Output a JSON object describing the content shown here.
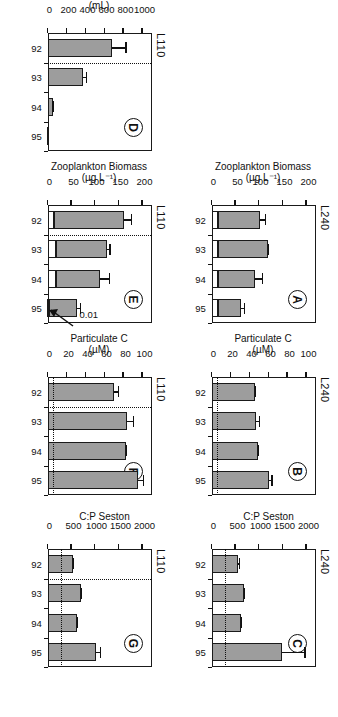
{
  "figure": {
    "years": [
      "92",
      "93",
      "94",
      "95"
    ],
    "lake_left": "L240",
    "lake_right": "L110",
    "bar_color": "#9d9d9d",
    "line_color": "#111111"
  },
  "panels": {
    "A": {
      "letter": "A",
      "lake": "L240",
      "axis_title": "Zooplankton Biomass",
      "axis_unit": "(µg L⁻¹)",
      "ticks": [
        "0",
        "50",
        "100",
        "150",
        "200"
      ],
      "categories": [
        "92",
        "93",
        "94",
        "95"
      ],
      "values": [
        102,
        118,
        92,
        62
      ],
      "base_values": [
        12,
        12,
        12,
        12
      ],
      "errors": [
        12,
        3,
        16,
        8
      ],
      "refline": null,
      "sepline": null
    },
    "B": {
      "letter": "B",
      "lake": "L240",
      "axis_title": "Particulate C",
      "axis_unit": "(µM)",
      "ticks": [
        "0",
        "20",
        "40",
        "60",
        "80",
        "100"
      ],
      "categories": [
        "92",
        "93",
        "94",
        "95"
      ],
      "values": [
        46,
        47,
        49,
        60
      ],
      "base_values": [
        0,
        0,
        0,
        0
      ],
      "errors": [
        1,
        4,
        1,
        4
      ],
      "refline": 6,
      "sepline": null
    },
    "C": {
      "letter": "C",
      "lake": "L240",
      "axis_title": "C:P Seston",
      "axis_unit": "",
      "ticks": [
        "0",
        "500",
        "1000",
        "1500",
        "2000"
      ],
      "categories": [
        "92",
        "93",
        "94",
        "95"
      ],
      "values": [
        560,
        680,
        620,
        1480
      ],
      "base_values": [
        0,
        0,
        0,
        0
      ],
      "errors": [
        40,
        20,
        15,
        500
      ],
      "refline": 300,
      "sepline": null
    },
    "D": {
      "letter": "D",
      "lake": "L110",
      "axis_title": "CPUE",
      "axis_unit": "(mL)",
      "ticks": [
        "0",
        "200",
        "400",
        "600",
        "800",
        "1000"
      ],
      "categories": [
        "92",
        "93",
        "94",
        "95"
      ],
      "values": [
        672,
        375,
        48,
        8
      ],
      "base_values": [
        0,
        0,
        0,
        0
      ],
      "errors": [
        160,
        40,
        12,
        0
      ],
      "refline": null,
      "sepline": true
    },
    "E": {
      "letter": "E",
      "lake": "L110",
      "axis_title": "Zooplankton Biomass",
      "axis_unit": "(µg L⁻¹)",
      "ticks": [
        "0",
        "50",
        "100",
        "150",
        "200"
      ],
      "categories": [
        "92",
        "93",
        "94",
        "95"
      ],
      "values": [
        160,
        124,
        110,
        62
      ],
      "base_values": [
        12,
        17,
        17,
        3
      ],
      "errors": [
        18,
        9,
        22,
        8
      ],
      "refline": null,
      "sepline": true,
      "annotation": {
        "label": "0.01",
        "target_category": "95"
      }
    },
    "F": {
      "letter": "F",
      "lake": "L110",
      "axis_title": "Particulate C",
      "axis_unit": "(µM)",
      "ticks": [
        "0",
        "20",
        "40",
        "60",
        "80",
        "100"
      ],
      "categories": [
        "92",
        "93",
        "94",
        "95"
      ],
      "values": [
        70,
        84,
        82,
        95
      ],
      "base_values": [
        0,
        0,
        0,
        0
      ],
      "errors": [
        5,
        7,
        2,
        7
      ],
      "refline": 6,
      "sepline": true
    },
    "G": {
      "letter": "G",
      "lake": "L110",
      "axis_title": "C:P Seston",
      "axis_unit": "",
      "ticks": [
        "0",
        "500",
        "1000",
        "1500",
        "2000"
      ],
      "categories": [
        "92",
        "93",
        "94",
        "95"
      ],
      "values": [
        520,
        700,
        620,
        1020
      ],
      "base_values": [
        0,
        0,
        0,
        0
      ],
      "errors": [
        30,
        25,
        15,
        110
      ],
      "refline": 300,
      "sepline": true
    }
  },
  "chart_data": [
    {
      "type": "bar",
      "title": "A",
      "subtitle": "L240",
      "categories": [
        "92",
        "93",
        "94",
        "95"
      ],
      "values": [
        102,
        118,
        92,
        62
      ],
      "errors": [
        12,
        3,
        16,
        8
      ],
      "stacked_base": [
        12,
        12,
        12,
        12
      ],
      "xlabel": "",
      "ylabel": "Zooplankton Biomass (µg L⁻¹)",
      "ylim": [
        0,
        200
      ],
      "yticks": [
        0,
        50,
        100,
        150,
        200
      ],
      "grid": false,
      "legend": "none"
    },
    {
      "type": "bar",
      "title": "B",
      "subtitle": "L240",
      "categories": [
        "92",
        "93",
        "94",
        "95"
      ],
      "values": [
        46,
        47,
        49,
        60
      ],
      "errors": [
        1,
        4,
        1,
        4
      ],
      "reference_line": 6,
      "xlabel": "",
      "ylabel": "Particulate C (µM)",
      "ylim": [
        0,
        100
      ],
      "yticks": [
        0,
        20,
        40,
        60,
        80,
        100
      ],
      "grid": false,
      "legend": "none"
    },
    {
      "type": "bar",
      "title": "C",
      "subtitle": "L240",
      "categories": [
        "92",
        "93",
        "94",
        "95"
      ],
      "values": [
        560,
        680,
        620,
        1480
      ],
      "errors": [
        40,
        20,
        15,
        500
      ],
      "reference_line": 300,
      "xlabel": "",
      "ylabel": "C:P Seston",
      "ylim": [
        0,
        2200
      ],
      "yticks": [
        0,
        500,
        1000,
        1500,
        2000
      ],
      "grid": false,
      "legend": "none"
    },
    {
      "type": "bar",
      "title": "D",
      "subtitle": "L110",
      "categories": [
        "92",
        "93",
        "94",
        "95"
      ],
      "values": [
        672,
        375,
        48,
        8
      ],
      "errors": [
        160,
        40,
        12,
        0
      ],
      "separator_after": "92",
      "xlabel": "",
      "ylabel": "CPUE (mL)",
      "ylim": [
        0,
        1100
      ],
      "yticks": [
        0,
        200,
        400,
        600,
        800,
        1000
      ],
      "grid": false,
      "legend": "none"
    },
    {
      "type": "bar",
      "title": "E",
      "subtitle": "L110",
      "categories": [
        "92",
        "93",
        "94",
        "95"
      ],
      "values": [
        160,
        124,
        110,
        62
      ],
      "errors": [
        18,
        9,
        22,
        8
      ],
      "stacked_base": [
        12,
        17,
        17,
        3
      ],
      "separator_after": "92",
      "annotations": [
        {
          "text": "0.01",
          "points_to": "95"
        }
      ],
      "xlabel": "",
      "ylabel": "Zooplankton Biomass (µg L⁻¹)",
      "ylim": [
        0,
        200
      ],
      "yticks": [
        0,
        50,
        100,
        150,
        200
      ],
      "grid": false,
      "legend": "none"
    },
    {
      "type": "bar",
      "title": "F",
      "subtitle": "L110",
      "categories": [
        "92",
        "93",
        "94",
        "95"
      ],
      "values": [
        70,
        84,
        82,
        95
      ],
      "errors": [
        5,
        7,
        2,
        7
      ],
      "reference_line": 6,
      "separator_after": "92",
      "xlabel": "",
      "ylabel": "Particulate C (µM)",
      "ylim": [
        0,
        100
      ],
      "yticks": [
        0,
        20,
        40,
        60,
        80,
        100
      ],
      "grid": false,
      "legend": "none"
    },
    {
      "type": "bar",
      "title": "G",
      "subtitle": "L110",
      "categories": [
        "92",
        "93",
        "94",
        "95"
      ],
      "values": [
        520,
        700,
        620,
        1020
      ],
      "errors": [
        30,
        25,
        15,
        110
      ],
      "reference_line": 300,
      "separator_after": "92",
      "xlabel": "",
      "ylabel": "C:P Seston",
      "ylim": [
        0,
        2200
      ],
      "yticks": [
        0,
        500,
        1000,
        1500,
        2000
      ],
      "grid": false,
      "legend": "none"
    }
  ]
}
